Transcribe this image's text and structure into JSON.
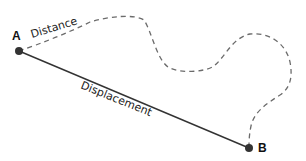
{
  "diagram": {
    "points": [
      {
        "label": "A",
        "x": 19,
        "y": 51
      },
      {
        "label": "B",
        "x": 249,
        "y": 148
      }
    ],
    "labels": {
      "distance": "Distance",
      "displacement": "Displacement",
      "point_a": "A",
      "point_b": "B"
    },
    "colors": {
      "dashed_path": "#666666",
      "straight_line": "#333333",
      "points": "#333333",
      "text": "#222222"
    }
  }
}
